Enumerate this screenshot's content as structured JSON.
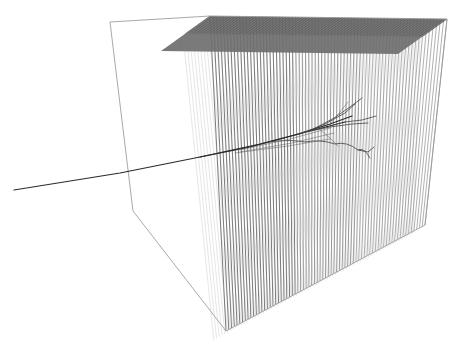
{
  "view": {
    "width": 461,
    "height": 347,
    "background_color": "#ffffff",
    "title": "",
    "caption": ""
  },
  "colors": {
    "box_wireframe": "#9a9a9a",
    "wire_plane_line": "#8e8e8e",
    "wire_plane_line_dark": "#6f6f6f",
    "top_face_fill": "#6e6e6e",
    "track_primary": "#2b2b2b",
    "track_secondary": "#454545",
    "track_faint": "#6a6a6a"
  },
  "chart_data": {
    "type": "scatter",
    "xlabel": "",
    "ylabel": "",
    "projection": "perspective-3d",
    "detector_box": {
      "name": "detector-volume",
      "corners_2d": {
        "top_back_left": [
          110,
          22
        ],
        "top_front_left": [
          210,
          16
        ],
        "top_front_right": [
          447,
          19
        ],
        "top_back_right": [
          398,
          52
        ],
        "bottom_back_left": [
          133,
          211
        ],
        "bottom_front_left": [
          226,
          331
        ],
        "bottom_front_right": [
          425,
          225
        ],
        "bottom_back_right": [
          398,
          196
        ]
      },
      "edges": [
        [
          "top_back_left",
          "top_front_left"
        ],
        [
          "top_front_left",
          "top_front_right"
        ],
        [
          "top_back_left",
          "bottom_back_left"
        ],
        [
          "bottom_back_left",
          "bottom_front_left"
        ],
        [
          "bottom_front_left",
          "bottom_front_right"
        ],
        [
          "top_front_right",
          "bottom_front_right"
        ]
      ]
    },
    "wire_planes": {
      "count": 72,
      "orientation": "vertical",
      "top_edge_from": [
        210,
        16
      ],
      "top_edge_to": [
        447,
        19
      ],
      "bottom_edge_from": [
        226,
        331
      ],
      "bottom_edge_to": [
        425,
        225
      ],
      "depth_offset_x": -49,
      "depth_offset_y": 35,
      "description": "dense curtain of vertical detector wire planes drawn in perspective"
    },
    "tracks": [
      {
        "name": "incoming-beam-track",
        "style": "solid-dark",
        "points": [
          [
            14,
            190
          ],
          [
            120,
            173
          ],
          [
            200,
            157
          ],
          [
            260,
            144
          ],
          [
            310,
            131
          ],
          [
            345,
            122
          ]
        ]
      },
      {
        "name": "shower-core",
        "style": "solid-dark",
        "points": [
          [
            200,
            157
          ],
          [
            250,
            147
          ],
          [
            295,
            135
          ],
          [
            330,
            124
          ],
          [
            352,
            116
          ]
        ]
      },
      {
        "name": "shower-branch-upper-1",
        "style": "solid",
        "points": [
          [
            300,
            134
          ],
          [
            325,
            124
          ],
          [
            345,
            113
          ],
          [
            355,
            104
          ]
        ]
      },
      {
        "name": "shower-branch-upper-2",
        "style": "solid",
        "points": [
          [
            312,
            130
          ],
          [
            334,
            118
          ],
          [
            350,
            107
          ],
          [
            362,
            98
          ]
        ]
      },
      {
        "name": "shower-branch-mid",
        "style": "solid",
        "points": [
          [
            304,
            132
          ],
          [
            330,
            127
          ],
          [
            352,
            124
          ],
          [
            368,
            123
          ]
        ]
      },
      {
        "name": "shower-branch-lower-arc",
        "style": "solid-curved",
        "points": [
          [
            270,
            142
          ],
          [
            305,
            142
          ],
          [
            335,
            144
          ],
          [
            358,
            150
          ],
          [
            370,
            158
          ]
        ]
      },
      {
        "name": "shower-branch-lower-tail",
        "style": "solid",
        "points": [
          [
            358,
            150
          ],
          [
            368,
            152
          ],
          [
            374,
            147
          ]
        ]
      },
      {
        "name": "shower-branch-right",
        "style": "solid",
        "points": [
          [
            345,
            122
          ],
          [
            362,
            120
          ],
          [
            376,
            116
          ]
        ]
      },
      {
        "name": "shower-branch-down",
        "style": "solid-thin",
        "points": [
          [
            318,
            128
          ],
          [
            330,
            138
          ],
          [
            338,
            146
          ]
        ]
      },
      {
        "name": "shower-branch-up-thin",
        "style": "solid-thin",
        "points": [
          [
            330,
            124
          ],
          [
            340,
            112
          ],
          [
            348,
            102
          ]
        ]
      },
      {
        "name": "shower-fan-a",
        "style": "solid-thin",
        "points": [
          [
            240,
            150
          ],
          [
            290,
            139
          ],
          [
            330,
            128
          ]
        ]
      },
      {
        "name": "shower-fan-b",
        "style": "solid-thin",
        "points": [
          [
            240,
            152
          ],
          [
            292,
            143
          ],
          [
            334,
            133
          ]
        ]
      },
      {
        "name": "shower-fan-c",
        "style": "solid-thin",
        "points": [
          [
            235,
            153
          ],
          [
            288,
            146
          ],
          [
            330,
            139
          ]
        ]
      }
    ]
  }
}
